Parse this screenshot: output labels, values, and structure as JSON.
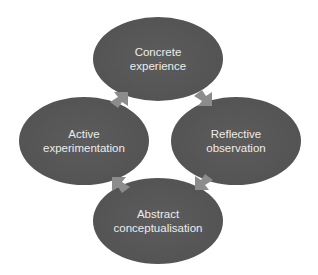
{
  "diagram": {
    "colors": {
      "node_fill": "#555555",
      "node_text": "#ececec",
      "arrow_fill": "#8c8c8c",
      "background": "#ffffff"
    },
    "nodes": [
      {
        "id": "top",
        "line1": "Concrete",
        "line2": "experience"
      },
      {
        "id": "right",
        "line1": "Reflective",
        "line2": "observation"
      },
      {
        "id": "bottom",
        "line1": "Abstract",
        "line2": "conceptualisation"
      },
      {
        "id": "left",
        "line1": "Active",
        "line2": "experimentation"
      }
    ],
    "edges": [
      {
        "from": "Concrete experience",
        "to": "Reflective observation"
      },
      {
        "from": "Reflective observation",
        "to": "Abstract conceptualisation"
      },
      {
        "from": "Abstract conceptualisation",
        "to": "Active experimentation"
      },
      {
        "from": "Active experimentation",
        "to": "Concrete experience"
      }
    ]
  }
}
